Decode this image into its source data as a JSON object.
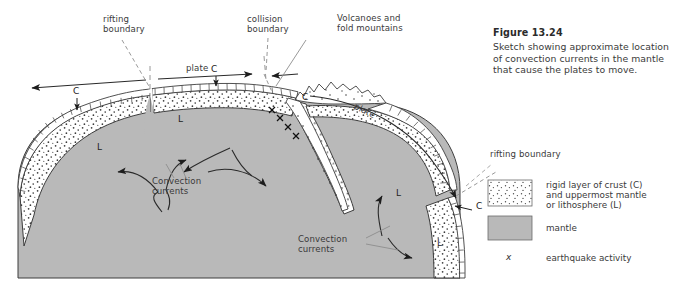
{
  "figure": {
    "number": "Figure 13.24",
    "caption": "Sketch showing approximate location\nof convection currents in the mantle\nthat cause the plates to move."
  },
  "diagram": {
    "labels": {
      "rifting_boundary_top": "rifting\nboundary",
      "collision_boundary": "collision\nboundary",
      "volcanoes": "Volcanoes and\nfold mountains",
      "plate_left": "plate",
      "plate_right": "plate",
      "convection_left": "Convection\ncurrents",
      "convection_right": "Convection\ncurrents",
      "crust_left": "C",
      "crust_mid": "C",
      "crust_arc": "C",
      "crust_right": "C",
      "litho_left": "L",
      "litho_mid": "L",
      "litho_right": "L",
      "litho_far_right": "L"
    }
  },
  "legend": {
    "rifting_boundary": "rifting boundary",
    "items": [
      {
        "swatch": "stipple",
        "text": "rigid layer of crust (C)\nand uppermost mantle\nor lithosphere (L)"
      },
      {
        "swatch": "mantle",
        "text": "mantle"
      },
      {
        "swatch": "x-mark",
        "symbol": "x",
        "text": "earthquake activity"
      }
    ]
  },
  "colors": {
    "mantle": "#b9b9b9",
    "mantle_dark": "#b0b0b0",
    "stroke": "#3d3d3d",
    "crust_white": "#ffffff",
    "text": "#3a3a3a",
    "leader": "#9a9a9a"
  }
}
